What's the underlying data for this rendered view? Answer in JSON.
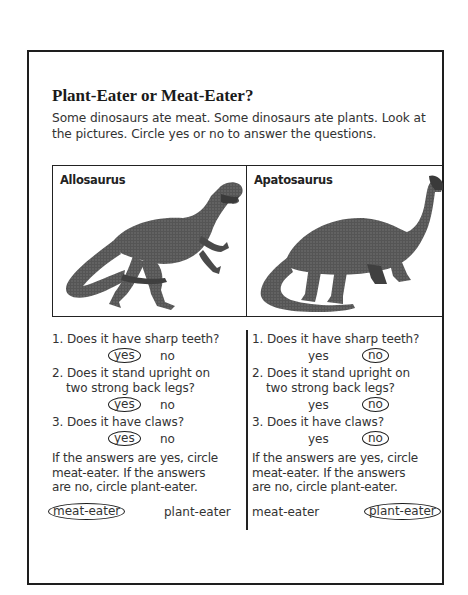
{
  "worksheet": {
    "title": "Plant-Eater or Meat-Eater?",
    "intro": "Some dinosaurs ate meat. Some dinosaurs ate plants. Look at the pictures. Circle yes or no to answer the questions."
  },
  "dinosaurs": [
    {
      "name": "Allosaurus",
      "image": "allosaurus-illustration",
      "questions": [
        {
          "text": "1. Does it have sharp teeth?",
          "yes": "yes",
          "no": "no",
          "circled": "yes"
        },
        {
          "text_line1": "2. Does it stand upright on",
          "text_line2": "two strong back legs?",
          "yes": "yes",
          "no": "no",
          "circled": "yes"
        },
        {
          "text": "3. Does it have claws?",
          "yes": "yes",
          "no": "no",
          "circled": "yes"
        }
      ],
      "conclusion_line1": "If the answers are yes, circle",
      "conclusion_line2": "meat-eater. If the answers",
      "conclusion_line3": "are no, circle plant-eater.",
      "choice_meat": "meat-eater",
      "choice_plant": "plant-eater",
      "circled_choice": "meat-eater"
    },
    {
      "name": "Apatosaurus",
      "image": "apatosaurus-illustration",
      "questions": [
        {
          "text": "1. Does it have sharp teeth?",
          "yes": "yes",
          "no": "no",
          "circled": "no"
        },
        {
          "text_line1": "2. Does it stand upright on",
          "text_line2": "two strong back legs?",
          "yes": "yes",
          "no": "no",
          "circled": "no"
        },
        {
          "text": "3. Does it have claws?",
          "yes": "yes",
          "no": "no",
          "circled": "no"
        }
      ],
      "conclusion_line1": "If the answers are yes, circle",
      "conclusion_line2": "meat-eater. If the answers",
      "conclusion_line3": "are no, circle plant-eater.",
      "choice_meat": "meat-eater",
      "choice_plant": "plant-eater",
      "circled_choice": "plant-eater"
    }
  ],
  "colors": {
    "ink": "#1e1e1e",
    "text": "#333333",
    "dino": "#4a4a4a"
  }
}
